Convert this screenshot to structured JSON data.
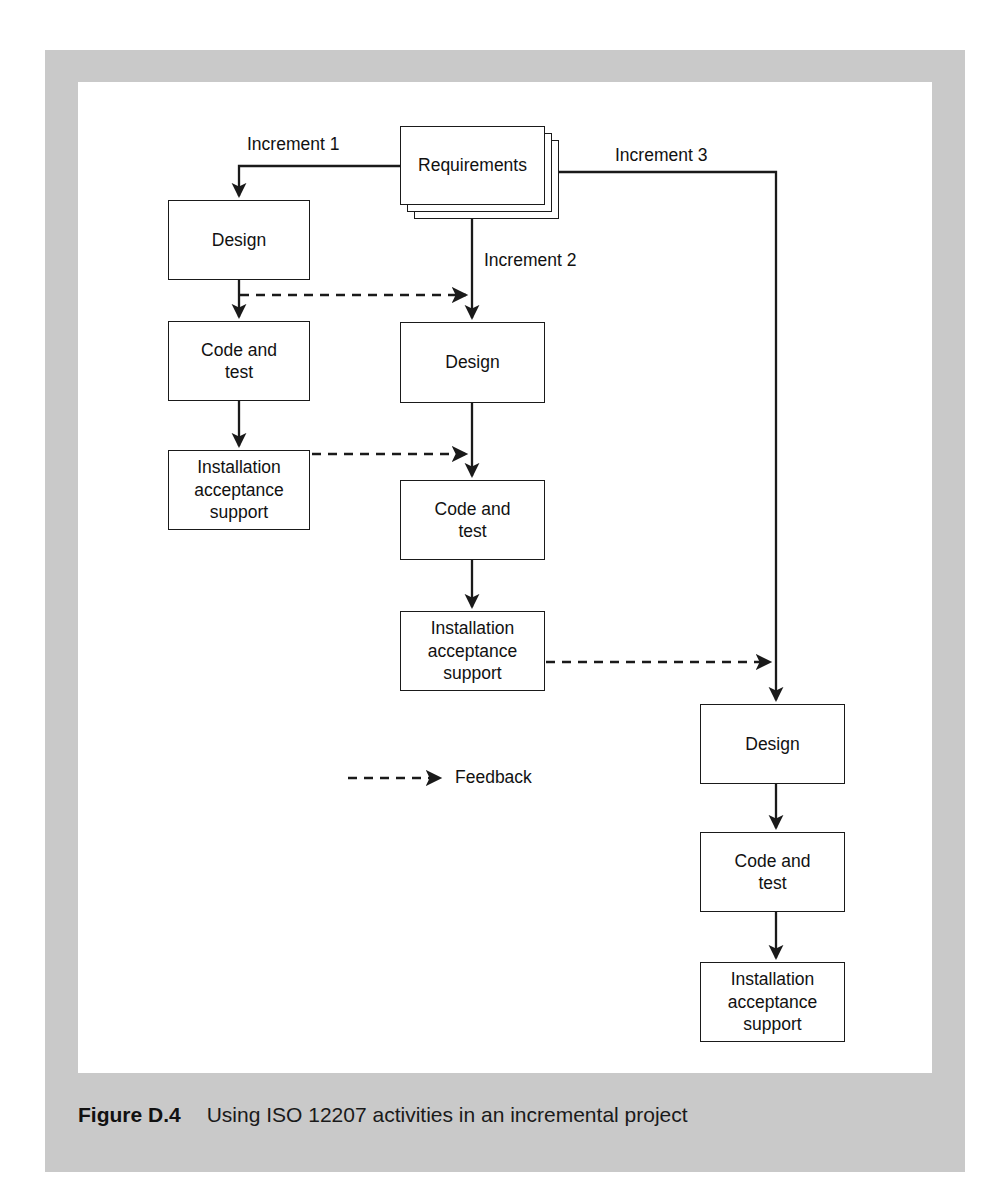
{
  "figure": {
    "caption_label": "Figure D.4",
    "caption_text": "Using ISO 12207 activities in an incremental project",
    "frame_color": "#c9c9c9",
    "line_color": "#1a1a1a",
    "canvas_color": "#ffffff"
  },
  "diagram": {
    "type": "flowchart",
    "source_node": {
      "id": "requirements",
      "label": "Requirements",
      "shape": "stacked-document",
      "stack_count": 3
    },
    "increments": [
      {
        "id": "increment-1",
        "label": "Increment 1",
        "column": 1,
        "nodes": [
          {
            "id": "design-1",
            "label": "Design"
          },
          {
            "id": "code-and-test-1",
            "label": "Code and\ntest"
          },
          {
            "id": "installation-1",
            "label": "Installation\nacceptance\nsupport"
          }
        ]
      },
      {
        "id": "increment-2",
        "label": "Increment 2",
        "column": 2,
        "nodes": [
          {
            "id": "design-2",
            "label": "Design"
          },
          {
            "id": "code-and-test-2",
            "label": "Code and\ntest"
          },
          {
            "id": "installation-2",
            "label": "Installation\nacceptance\nsupport"
          }
        ]
      },
      {
        "id": "increment-3",
        "label": "Increment 3",
        "column": 3,
        "nodes": [
          {
            "id": "design-3",
            "label": "Design"
          },
          {
            "id": "code-and-test-3",
            "label": "Code and\ntest"
          },
          {
            "id": "installation-3",
            "label": "Installation\nacceptance\nsupport"
          }
        ]
      }
    ],
    "feedback_edges": [
      {
        "from": "design-1",
        "to": "increment-2-flow",
        "style": "dashed"
      },
      {
        "from": "installation-1",
        "to": "increment-2-flow",
        "style": "dashed"
      },
      {
        "from": "installation-2",
        "to": "increment-3-flow",
        "style": "dashed"
      }
    ],
    "legend": {
      "items": [
        {
          "id": "feedback",
          "label": "Feedback",
          "style": "dashed-arrow"
        }
      ]
    }
  }
}
